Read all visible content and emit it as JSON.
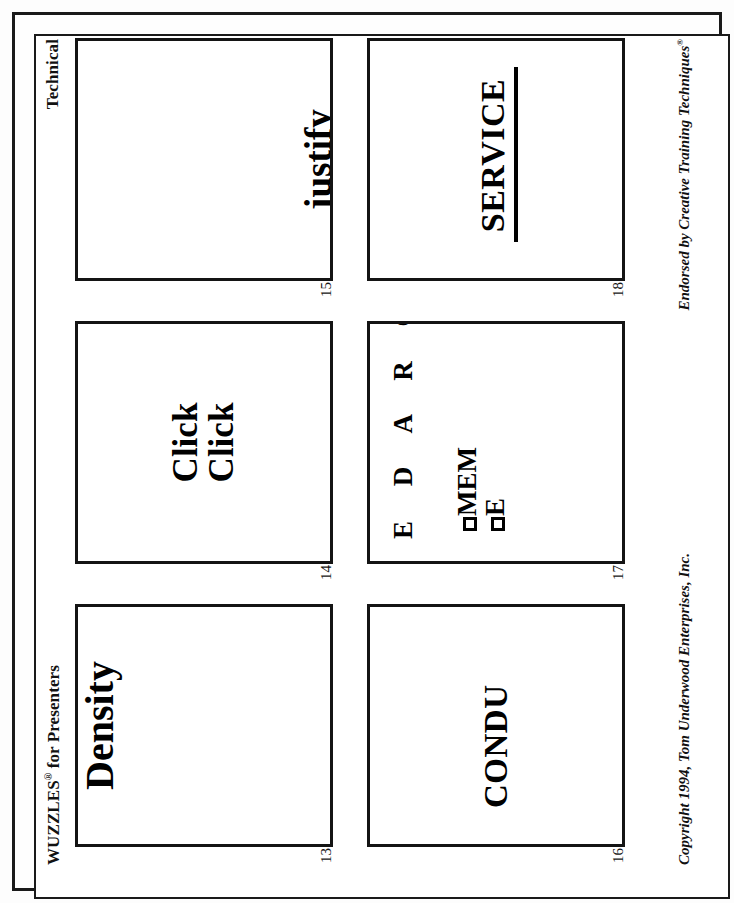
{
  "document": {
    "type": "worksheet",
    "orientation": "landscape-rotated-90",
    "background": "#ffffff",
    "ink": "#111111"
  },
  "header": {
    "left_title": "WUZZLES",
    "left_title_mark": "®",
    "left_title_suffix": " for Presenters",
    "right_title": "Technical"
  },
  "footer": {
    "left_text": "Copyright 1994, Tom Underwood Enterprises, Inc.",
    "right_text": "Endorsed by Creative Training Techniques",
    "right_text_mark": "®"
  },
  "puzzles": [
    {
      "number": "13",
      "style": "puz-density",
      "answer_text": "Density",
      "lines": [
        "Density"
      ],
      "alignment": "top-center"
    },
    {
      "number": "14",
      "style": "puz-clickclick",
      "answer_text": "Click Click",
      "lines": [
        "Click",
        "Click"
      ],
      "alignment": "center"
    },
    {
      "number": "15",
      "style": "puz-justify",
      "answer_text": "justify",
      "lines": [
        "justify"
      ],
      "alignment": "bottom-center"
    },
    {
      "number": "16",
      "style": "puz-condu",
      "answer_text": "CONDU",
      "lines": [
        "CONDU"
      ],
      "alignment": "center-left-clipped"
    },
    {
      "number": "17",
      "style": "puz-mem",
      "answer_text": "E D A R G / MEM / E",
      "spaced_row": "E D A R G",
      "lines": [
        "MEM",
        "E"
      ],
      "alignment": "top-left"
    },
    {
      "number": "18",
      "style": "puz-service",
      "answer_text": "SERVICE",
      "lines": [
        "SERVICE"
      ],
      "underline": true,
      "alignment": "center"
    }
  ]
}
